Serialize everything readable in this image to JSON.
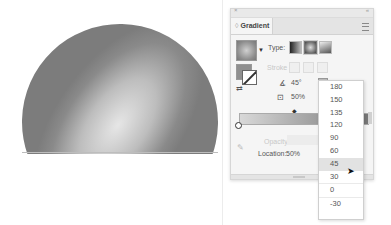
{
  "canvas": {
    "shape": "half-sphere with radial gradient",
    "gradient_colors": [
      "#e6e6e6",
      "#7c7c7c"
    ]
  },
  "panel": {
    "tab_label": "Gradient",
    "type_label": "Type:",
    "type_options": [
      "linear-gradient-icon",
      "radial-gradient-icon",
      "freeform-gradient-icon"
    ],
    "type_selected": "radial",
    "stroke_label": "Stroke",
    "angle_icon": "∡",
    "angle_value": "45°",
    "aspect_icon": "⊡",
    "aspect_value": "50%",
    "opacity_label": "Opacity:",
    "location_label": "Location:",
    "location_value": "50%"
  },
  "dropdown": {
    "items": [
      "180",
      "150",
      "135",
      "120",
      "90",
      "60",
      "45",
      "30",
      "0",
      "-30"
    ],
    "selected": "45"
  }
}
